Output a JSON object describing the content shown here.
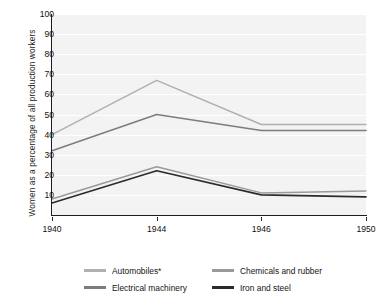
{
  "chart_data": {
    "type": "line",
    "title": "",
    "xlabel": "",
    "ylabel": "Women as a percentage of all production workers",
    "x": [
      "1940",
      "1944",
      "1946",
      "1950"
    ],
    "categories": [
      "1940",
      "1944",
      "1946",
      "1950"
    ],
    "ylim": [
      0,
      100
    ],
    "ytick_values": [
      10,
      20,
      30,
      40,
      50,
      60,
      70,
      80,
      90,
      100
    ],
    "ytick_labels": [
      "10",
      "20",
      "30",
      "40",
      "50",
      "60",
      "70",
      "80",
      "90",
      "100"
    ],
    "grid": "horizontal",
    "legend_position": "bottom",
    "series": [
      {
        "name": "Automobiles*",
        "values": [
          40,
          67,
          45,
          45
        ],
        "color": "#b0b0b0"
      },
      {
        "name": "Electrical machinery",
        "values": [
          32,
          50,
          42,
          42
        ],
        "color": "#7d7d7d"
      },
      {
        "name": "Chemicals and rubber",
        "values": [
          8,
          24,
          11,
          12
        ],
        "color": "#9a9a9a"
      },
      {
        "name": "Iron and steel",
        "values": [
          6,
          22,
          10,
          9
        ],
        "color": "#2b2b2b"
      }
    ]
  },
  "colors": {
    "plot_background": "#f3f3f3",
    "page_background": "#ffffff",
    "axis": "#1d1d1d",
    "gridline": "#ffffff",
    "text": "#111111"
  },
  "axis": {
    "y_title": "Women as a percentage of all production workers",
    "y_ticks": [
      "100",
      "90",
      "80",
      "70",
      "60",
      "50",
      "40",
      "30",
      "20",
      "10"
    ],
    "x_ticks": [
      "1940",
      "1944",
      "1946",
      "1950"
    ]
  },
  "legend": {
    "items": [
      {
        "label": "Automobiles*",
        "color": "#b0b0b0"
      },
      {
        "label": "Electrical machinery",
        "color": "#7d7d7d"
      },
      {
        "label": "Chemicals and rubber",
        "color": "#9a9a9a"
      },
      {
        "label": "Iron and steel",
        "color": "#2b2b2b"
      }
    ]
  }
}
